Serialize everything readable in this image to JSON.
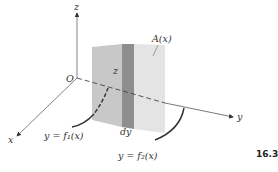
{
  "figure": {
    "number": "16.3",
    "labels": {
      "z_axis": "z",
      "y_axis": "y",
      "x_axis": "x",
      "origin": "O",
      "area": "A(x)",
      "height": "z",
      "thickness": "dy",
      "curve1": "y = f₁(x)",
      "curve2": "y = f₂(x)"
    }
  },
  "colors": {
    "axis": "#555555",
    "slab_left": "#c6c6c6",
    "slab_strip": "#8c8c8c",
    "slab_right": "#e2e2e2",
    "curve": "#333333"
  }
}
